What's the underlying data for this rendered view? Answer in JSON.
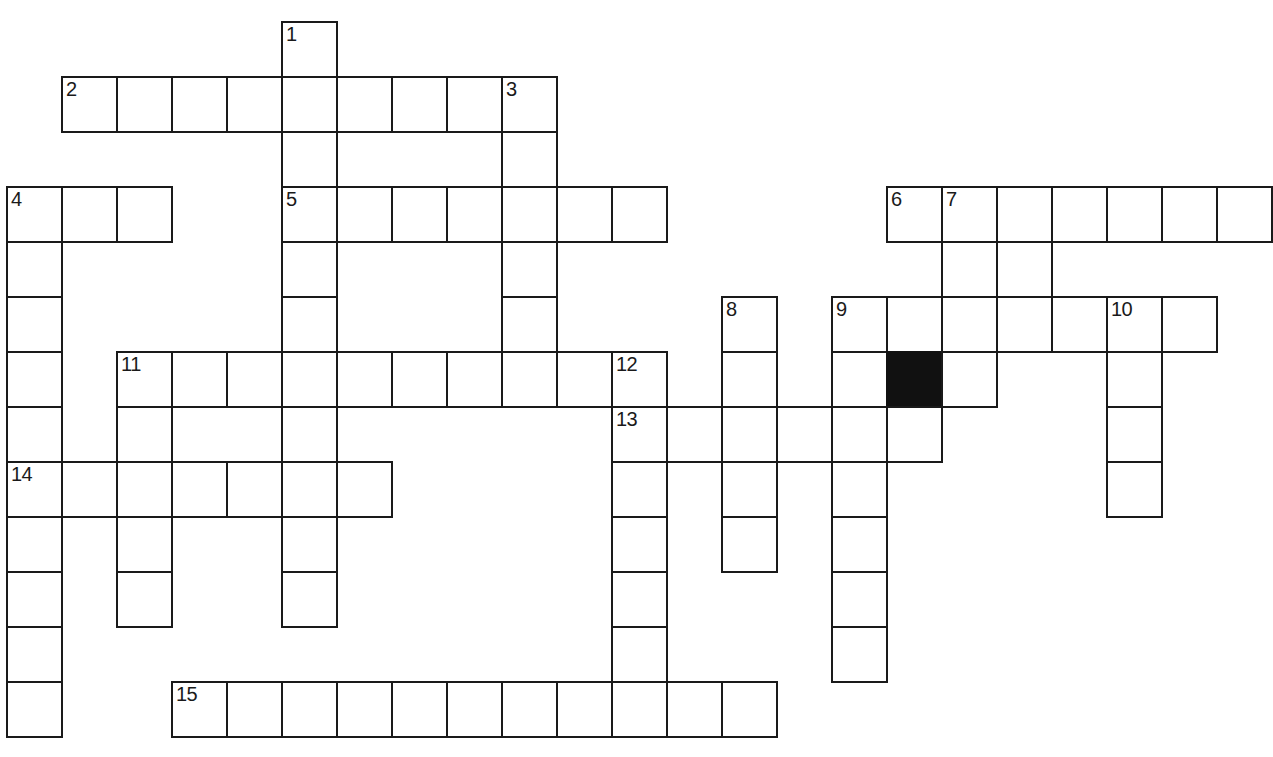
{
  "page": {
    "background_color": "#ffffff",
    "ink_color": "#1a1a1a",
    "blocked_color": "#111111",
    "width": 1273,
    "height": 757,
    "top_edge_artifact": ""
  },
  "grid": {
    "origin_x": 6,
    "origin_y": 21,
    "cell_size": 55,
    "border_width": 2,
    "columns": 24,
    "rows": 13,
    "cells": [
      {
        "r": 0,
        "c": 5,
        "number": "1"
      },
      {
        "r": 1,
        "c": 1,
        "number": "2"
      },
      {
        "r": 1,
        "c": 2,
        "number": ""
      },
      {
        "r": 1,
        "c": 3,
        "number": ""
      },
      {
        "r": 1,
        "c": 4,
        "number": ""
      },
      {
        "r": 1,
        "c": 5,
        "number": ""
      },
      {
        "r": 1,
        "c": 6,
        "number": ""
      },
      {
        "r": 1,
        "c": 7,
        "number": ""
      },
      {
        "r": 1,
        "c": 8,
        "number": ""
      },
      {
        "r": 1,
        "c": 9,
        "number": "3"
      },
      {
        "r": 2,
        "c": 5,
        "number": ""
      },
      {
        "r": 2,
        "c": 9,
        "number": ""
      },
      {
        "r": 3,
        "c": 0,
        "number": "4"
      },
      {
        "r": 3,
        "c": 1,
        "number": ""
      },
      {
        "r": 3,
        "c": 2,
        "number": ""
      },
      {
        "r": 3,
        "c": 5,
        "number": "5"
      },
      {
        "r": 3,
        "c": 6,
        "number": ""
      },
      {
        "r": 3,
        "c": 7,
        "number": ""
      },
      {
        "r": 3,
        "c": 8,
        "number": ""
      },
      {
        "r": 3,
        "c": 9,
        "number": ""
      },
      {
        "r": 3,
        "c": 10,
        "number": ""
      },
      {
        "r": 3,
        "c": 11,
        "number": ""
      },
      {
        "r": 3,
        "c": 16,
        "number": "6"
      },
      {
        "r": 3,
        "c": 17,
        "number": "7"
      },
      {
        "r": 3,
        "c": 18,
        "number": ""
      },
      {
        "r": 3,
        "c": 19,
        "number": ""
      },
      {
        "r": 3,
        "c": 20,
        "number": ""
      },
      {
        "r": 3,
        "c": 21,
        "number": ""
      },
      {
        "r": 3,
        "c": 22,
        "number": ""
      },
      {
        "r": 4,
        "c": 0,
        "number": ""
      },
      {
        "r": 4,
        "c": 5,
        "number": ""
      },
      {
        "r": 4,
        "c": 9,
        "number": ""
      },
      {
        "r": 4,
        "c": 17,
        "number": ""
      },
      {
        "r": 4,
        "c": 18,
        "number": ""
      },
      {
        "r": 5,
        "c": 0,
        "number": ""
      },
      {
        "r": 5,
        "c": 5,
        "number": ""
      },
      {
        "r": 5,
        "c": 9,
        "number": ""
      },
      {
        "r": 5,
        "c": 13,
        "number": "8"
      },
      {
        "r": 5,
        "c": 15,
        "number": "9"
      },
      {
        "r": 5,
        "c": 16,
        "number": ""
      },
      {
        "r": 5,
        "c": 17,
        "number": ""
      },
      {
        "r": 5,
        "c": 18,
        "number": ""
      },
      {
        "r": 5,
        "c": 19,
        "number": ""
      },
      {
        "r": 5,
        "c": 20,
        "number": "10"
      },
      {
        "r": 5,
        "c": 21,
        "number": ""
      },
      {
        "r": 6,
        "c": 0,
        "number": ""
      },
      {
        "r": 6,
        "c": 2,
        "number": "11"
      },
      {
        "r": 6,
        "c": 3,
        "number": ""
      },
      {
        "r": 6,
        "c": 4,
        "number": ""
      },
      {
        "r": 6,
        "c": 5,
        "number": ""
      },
      {
        "r": 6,
        "c": 6,
        "number": ""
      },
      {
        "r": 6,
        "c": 7,
        "number": ""
      },
      {
        "r": 6,
        "c": 8,
        "number": ""
      },
      {
        "r": 6,
        "c": 9,
        "number": ""
      },
      {
        "r": 6,
        "c": 10,
        "number": ""
      },
      {
        "r": 6,
        "c": 11,
        "number": "12"
      },
      {
        "r": 6,
        "c": 13,
        "number": ""
      },
      {
        "r": 6,
        "c": 15,
        "number": ""
      },
      {
        "r": 6,
        "c": 16,
        "number": "",
        "blocked": true
      },
      {
        "r": 6,
        "c": 17,
        "number": ""
      },
      {
        "r": 6,
        "c": 20,
        "number": ""
      },
      {
        "r": 7,
        "c": 0,
        "number": ""
      },
      {
        "r": 7,
        "c": 2,
        "number": ""
      },
      {
        "r": 7,
        "c": 5,
        "number": ""
      },
      {
        "r": 7,
        "c": 11,
        "number": "13"
      },
      {
        "r": 7,
        "c": 12,
        "number": ""
      },
      {
        "r": 7,
        "c": 13,
        "number": ""
      },
      {
        "r": 7,
        "c": 14,
        "number": ""
      },
      {
        "r": 7,
        "c": 15,
        "number": ""
      },
      {
        "r": 7,
        "c": 16,
        "number": ""
      },
      {
        "r": 7,
        "c": 20,
        "number": ""
      },
      {
        "r": 8,
        "c": 0,
        "number": "14"
      },
      {
        "r": 8,
        "c": 1,
        "number": ""
      },
      {
        "r": 8,
        "c": 2,
        "number": ""
      },
      {
        "r": 8,
        "c": 3,
        "number": ""
      },
      {
        "r": 8,
        "c": 4,
        "number": ""
      },
      {
        "r": 8,
        "c": 5,
        "number": ""
      },
      {
        "r": 8,
        "c": 6,
        "number": ""
      },
      {
        "r": 8,
        "c": 11,
        "number": ""
      },
      {
        "r": 8,
        "c": 13,
        "number": ""
      },
      {
        "r": 8,
        "c": 15,
        "number": ""
      },
      {
        "r": 8,
        "c": 20,
        "number": ""
      },
      {
        "r": 9,
        "c": 0,
        "number": ""
      },
      {
        "r": 9,
        "c": 2,
        "number": ""
      },
      {
        "r": 9,
        "c": 5,
        "number": ""
      },
      {
        "r": 9,
        "c": 11,
        "number": ""
      },
      {
        "r": 9,
        "c": 13,
        "number": ""
      },
      {
        "r": 9,
        "c": 15,
        "number": ""
      },
      {
        "r": 10,
        "c": 0,
        "number": ""
      },
      {
        "r": 10,
        "c": 2,
        "number": ""
      },
      {
        "r": 10,
        "c": 5,
        "number": ""
      },
      {
        "r": 10,
        "c": 11,
        "number": ""
      },
      {
        "r": 10,
        "c": 15,
        "number": ""
      },
      {
        "r": 11,
        "c": 0,
        "number": ""
      },
      {
        "r": 11,
        "c": 11,
        "number": ""
      },
      {
        "r": 11,
        "c": 15,
        "number": ""
      },
      {
        "r": 12,
        "c": 0,
        "number": ""
      },
      {
        "r": 12,
        "c": 3,
        "number": "15"
      },
      {
        "r": 12,
        "c": 4,
        "number": ""
      },
      {
        "r": 12,
        "c": 5,
        "number": ""
      },
      {
        "r": 12,
        "c": 6,
        "number": ""
      },
      {
        "r": 12,
        "c": 7,
        "number": ""
      },
      {
        "r": 12,
        "c": 8,
        "number": ""
      },
      {
        "r": 12,
        "c": 9,
        "number": ""
      },
      {
        "r": 12,
        "c": 10,
        "number": ""
      },
      {
        "r": 12,
        "c": 11,
        "number": ""
      },
      {
        "r": 12,
        "c": 12,
        "number": ""
      },
      {
        "r": 12,
        "c": 13,
        "number": ""
      }
    ],
    "clue_numbers": [
      "1",
      "2",
      "3",
      "4",
      "5",
      "6",
      "7",
      "8",
      "9",
      "10",
      "11",
      "12",
      "13",
      "14",
      "15"
    ],
    "entries": [
      {
        "number": "1",
        "direction": "down",
        "start_row": 0,
        "start_col": 5,
        "length": 11
      },
      {
        "number": "2",
        "direction": "across",
        "start_row": 1,
        "start_col": 1,
        "length": 8
      },
      {
        "number": "3",
        "direction": "down",
        "start_row": 1,
        "start_col": 9,
        "length": 5
      },
      {
        "number": "4",
        "direction": "down",
        "start_row": 3,
        "start_col": 0,
        "length": 10
      },
      {
        "number": "4",
        "direction": "across",
        "start_row": 3,
        "start_col": 0,
        "length": 3
      },
      {
        "number": "5",
        "direction": "across",
        "start_row": 3,
        "start_col": 5,
        "length": 7
      },
      {
        "number": "6",
        "direction": "across",
        "start_row": 3,
        "start_col": 16,
        "length": 7
      },
      {
        "number": "7",
        "direction": "down",
        "start_row": 3,
        "start_col": 17,
        "length": 4
      },
      {
        "number": "8",
        "direction": "down",
        "start_row": 5,
        "start_col": 13,
        "length": 6
      },
      {
        "number": "9",
        "direction": "across",
        "start_row": 5,
        "start_col": 15,
        "length": 7
      },
      {
        "number": "9",
        "direction": "down",
        "start_row": 5,
        "start_col": 15,
        "length": 7
      },
      {
        "number": "10",
        "direction": "down",
        "start_row": 5,
        "start_col": 20,
        "length": 4
      },
      {
        "number": "11",
        "direction": "across",
        "start_row": 6,
        "start_col": 2,
        "length": 9
      },
      {
        "number": "11",
        "direction": "down",
        "start_row": 6,
        "start_col": 2,
        "length": 5
      },
      {
        "number": "12",
        "direction": "down",
        "start_row": 6,
        "start_col": 11,
        "length": 7
      },
      {
        "number": "13",
        "direction": "across",
        "start_row": 7,
        "start_col": 11,
        "length": 6
      },
      {
        "number": "14",
        "direction": "across",
        "start_row": 8,
        "start_col": 0,
        "length": 7
      },
      {
        "number": "15",
        "direction": "across",
        "start_row": 12,
        "start_col": 3,
        "length": 11
      }
    ]
  }
}
